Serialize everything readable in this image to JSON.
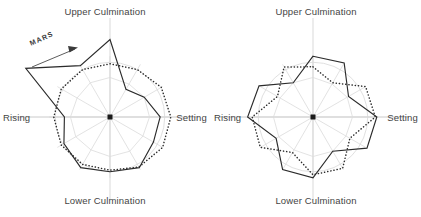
{
  "figure": {
    "background": "#ffffff",
    "stroke_solid": "#2b2b2b",
    "stroke_dotted": "#2b2b2b",
    "stroke_guide": "#c9c9c9",
    "stroke_axis": "#b8b8b8",
    "center_marker": "#111111"
  },
  "panels": [
    {
      "id": "left",
      "annotation": {
        "text": "MARS",
        "arrow": "arrow-up-right-icon"
      },
      "labels": {
        "top": "Upper Culmination",
        "bottom": "Lower Culmination",
        "left": "Rising",
        "right": "Setting"
      }
    },
    {
      "id": "right",
      "labels": {
        "top": "Upper Culmination",
        "bottom": "Lower Culmination",
        "left": "Rising",
        "right": "Setting"
      }
    }
  ],
  "chart_data": [
    {
      "type": "line",
      "subtype": "polar-radar",
      "title": "Upper Culmination",
      "panel": "left",
      "xlabel": "",
      "ylabel": "",
      "grid": true,
      "legend": "none",
      "angle_labels": {
        "90": "Upper Culmination",
        "180": "Rising",
        "270": "Lower Culmination",
        "0": "Setting"
      },
      "angles_deg": [
        90,
        60,
        30,
        0,
        330,
        300,
        270,
        240,
        210,
        180,
        150,
        120
      ],
      "rlim": [
        0,
        1.0
      ],
      "guide_circle_r": 0.72,
      "series": [
        {
          "name": "solid-curve",
          "style": "solid",
          "radii": [
            1.02,
            0.42,
            0.52,
            0.66,
            0.66,
            0.77,
            0.72,
            0.77,
            0.7,
            0.6,
            1.28,
            0.78
          ]
        },
        {
          "name": "dotted-curve",
          "style": "dotted",
          "radii": [
            0.7,
            0.72,
            0.78,
            0.8,
            0.8,
            0.76,
            0.7,
            0.72,
            0.74,
            0.74,
            0.74,
            0.72
          ]
        },
        {
          "name": "guide-polygon",
          "style": "faint",
          "radii": [
            0.52,
            0.5,
            0.52,
            0.52,
            0.5,
            0.52,
            0.52,
            0.5,
            0.52,
            0.52,
            0.5,
            0.52
          ]
        }
      ]
    },
    {
      "type": "line",
      "subtype": "polar-radar",
      "title": "Upper Culmination",
      "panel": "right",
      "xlabel": "",
      "ylabel": "",
      "grid": true,
      "legend": "none",
      "angle_labels": {
        "90": "Upper Culmination",
        "180": "Rising",
        "270": "Lower Culmination",
        "0": "Setting"
      },
      "angles_deg": [
        90,
        60,
        30,
        0,
        330,
        300,
        270,
        240,
        210,
        180,
        150,
        120
      ],
      "rlim": [
        0,
        1.0
      ],
      "guide_circle_r": 0.72,
      "series": [
        {
          "name": "solid-curve",
          "style": "solid",
          "radii": [
            0.8,
            0.82,
            0.54,
            0.84,
            0.82,
            0.52,
            0.8,
            0.8,
            0.56,
            0.86,
            0.82,
            0.52
          ]
        },
        {
          "name": "dotted-curve",
          "style": "dotted",
          "radii": [
            0.66,
            0.52,
            0.8,
            0.82,
            0.56,
            0.78,
            0.76,
            0.54,
            0.8,
            0.8,
            0.54,
            0.76
          ]
        },
        {
          "name": "guide-polygon",
          "style": "faint",
          "radii": [
            0.52,
            0.5,
            0.52,
            0.52,
            0.5,
            0.52,
            0.52,
            0.5,
            0.52,
            0.52,
            0.5,
            0.52
          ]
        }
      ]
    }
  ]
}
